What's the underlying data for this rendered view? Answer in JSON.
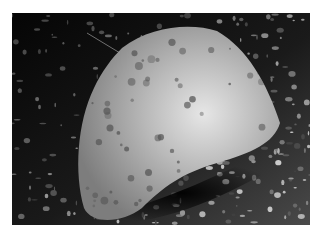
{
  "image": {
    "subject": "flatfish",
    "description": "Grayscale photograph of a spotted flatfish resting on a gravel seabed at night",
    "colors": {
      "border": "#ffffff",
      "background": "#050505",
      "fish_light": "#d8d8d8",
      "fish_mid": "#a8a8a8",
      "spot": "#5a5a5a",
      "gravel": "#8a8a8a"
    }
  }
}
